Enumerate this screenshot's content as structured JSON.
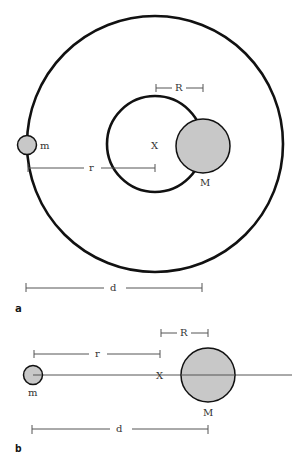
{
  "panels": {
    "a": {
      "label": "a",
      "labels": {
        "m": "m",
        "M": "M",
        "X": "X",
        "r": "r",
        "R": "R",
        "d": "d"
      }
    },
    "b": {
      "label": "b",
      "labels": {
        "m": "m",
        "M": "M",
        "X": "X",
        "r": "r",
        "R": "R",
        "d": "d"
      }
    }
  },
  "colors": {
    "stroke": "#111111",
    "bodyFill": "#c8c8c8",
    "dimLine": "#555555"
  }
}
